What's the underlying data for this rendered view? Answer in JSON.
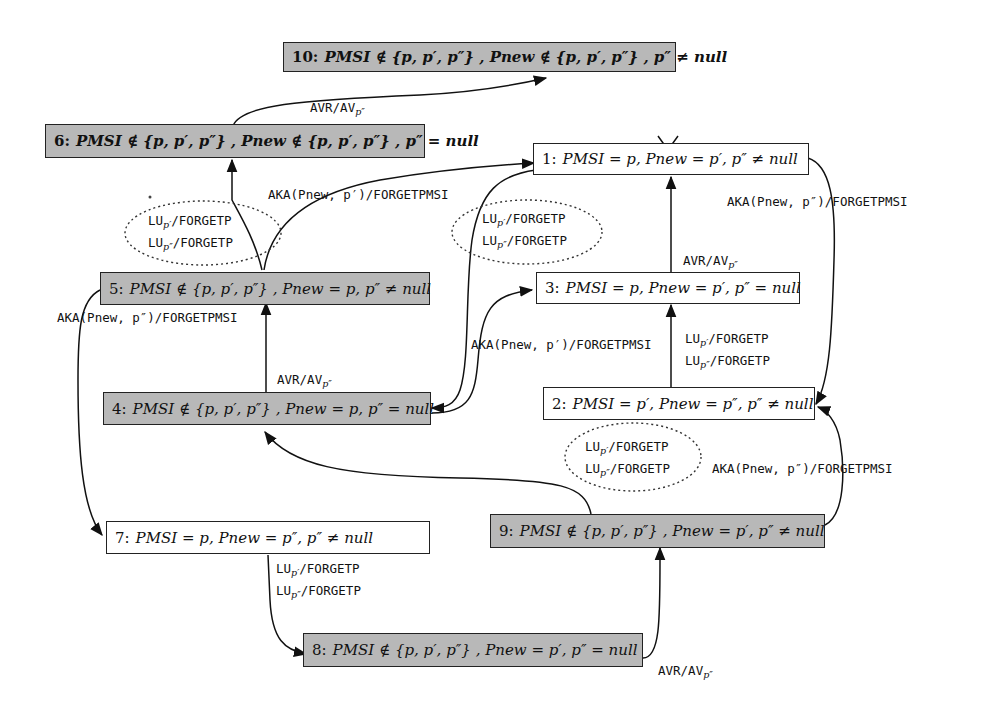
{
  "diagram": {
    "type": "state-machine",
    "nodes": [
      {
        "id": 10,
        "num": "10:",
        "text": "PMSI ∉ {p, p′, p″} , Pnew ∉ {p, p′, p″} , p″ ≠ null",
        "style": "gray-bold"
      },
      {
        "id": 6,
        "num": "6:",
        "text": "PMSI ∉ {p, p′, p″} , Pnew ∉ {p, p′, p″} , p″ = null",
        "style": "gray-bold"
      },
      {
        "id": 1,
        "num": "1:",
        "text": "PMSI = p, Pnew = p′, p″ ≠ null",
        "style": "white",
        "initial": true
      },
      {
        "id": 5,
        "num": "5:",
        "text": "PMSI ∉ {p, p′, p″} , Pnew = p, p″ ≠ null",
        "style": "gray"
      },
      {
        "id": 3,
        "num": "3:",
        "text": "PMSI = p, Pnew = p′, p″ = null",
        "style": "white"
      },
      {
        "id": 4,
        "num": "4:",
        "text": "PMSI ∉ {p, p′, p″} , Pnew = p, p″ = null",
        "style": "gray"
      },
      {
        "id": 2,
        "num": "2:",
        "text": "PMSI = p′, Pnew = p″, p″ ≠ null",
        "style": "white"
      },
      {
        "id": 7,
        "num": "7:",
        "text": "PMSI = p, Pnew = p″, p″ ≠ null",
        "style": "white"
      },
      {
        "id": 9,
        "num": "9:",
        "text": "PMSI ∉ {p, p′, p″} , Pnew = p′, p″ ≠ null",
        "style": "gray"
      },
      {
        "id": 8,
        "num": "8:",
        "text": "PMSI ∉ {p, p′, p″} , Pnew = p′, p″ = null",
        "style": "gray"
      }
    ],
    "edges": [
      {
        "from": 6,
        "to": 10,
        "label": "AVR/AVp″"
      },
      {
        "from": 5,
        "to": 6,
        "label": "LUp′/FORGETP ; LUp″/FORGETP"
      },
      {
        "from": 5,
        "to": 1,
        "label": "AKA(Pnew, p′)/FORGETPMSI"
      },
      {
        "from": 1,
        "to": 4,
        "label": "LUp′/FORGETP ; LUp″/FORGETP"
      },
      {
        "from": 1,
        "to": 2,
        "label": "AKA(Pnew, p″)/FORGETPMSI"
      },
      {
        "from": 3,
        "to": 1,
        "label": "AVR/AVp″"
      },
      {
        "from": 4,
        "to": 3,
        "label": "AKA(Pnew, p′)/FORGETPMSI"
      },
      {
        "from": 4,
        "to": 5,
        "label": "AVR/AVp″"
      },
      {
        "from": 2,
        "to": 3,
        "label": "LUp′/FORGETP ; LUp″/FORGETP"
      },
      {
        "from": 5,
        "to": 7,
        "label": "AKA(Pnew, p″)/FORGETPMSI"
      },
      {
        "from": 9,
        "to": 4,
        "label": "LUp′/FORGETP ; LUp″/FORGETP"
      },
      {
        "from": 9,
        "to": 2,
        "label": "AKA(Pnew, p″)/FORGETPMSI"
      },
      {
        "from": 7,
        "to": 8,
        "label": "LUp′/FORGETP ; LUp″/FORGETP"
      },
      {
        "from": 8,
        "to": 9,
        "label": "AVR/AVp″"
      }
    ]
  },
  "labels": {
    "avr_main": "AVR/AV",
    "avr_sub": "p″",
    "lu_p1_main": "LU",
    "lu_p1_sub": "p′",
    "lu_p2_main": "LU",
    "lu_p2_sub": "p″",
    "forgetp": "/FORGETP",
    "aka_p1": "AKA(Pnew, p′)/FORGETPMSI",
    "aka_p2": "AKA(Pnew, p″)/FORGETPMSI"
  },
  "nodes_text": {
    "n10": {
      "num": "10:",
      "text": "PMSI ∉ {p, p′, p″} , Pnew ∉ {p, p′, p″} , p″ ≠ null"
    },
    "n6": {
      "num": "6:",
      "text": "PMSI ∉ {p, p′, p″} , Pnew ∉ {p, p′, p″} , p″ = null"
    },
    "n1": {
      "num": "1:",
      "text": "PMSI = p, Pnew = p′, p″ ≠ null"
    },
    "n5": {
      "num": "5:",
      "text": "PMSI ∉ {p, p′, p″} , Pnew = p, p″ ≠ null"
    },
    "n3": {
      "num": "3:",
      "text": "PMSI = p, Pnew = p′, p″ = null"
    },
    "n4": {
      "num": "4:",
      "text": "PMSI ∉ {p, p′, p″} , Pnew = p, p″ = null"
    },
    "n2": {
      "num": "2:",
      "text": "PMSI = p′, Pnew = p″, p″ ≠ null"
    },
    "n7": {
      "num": "7:",
      "text": "PMSI = p, Pnew = p″, p″ ≠ null"
    },
    "n9": {
      "num": "9:",
      "text": "PMSI ∉ {p, p′, p″} , Pnew = p′, p″ ≠ null"
    },
    "n8": {
      "num": "8:",
      "text": "PMSI ∉ {p, p′, p″} , Pnew = p′, p″ = null"
    }
  },
  "colors": {
    "gray_fill": "#b8b8b8",
    "white_fill": "#ffffff",
    "stroke": "#222222"
  }
}
